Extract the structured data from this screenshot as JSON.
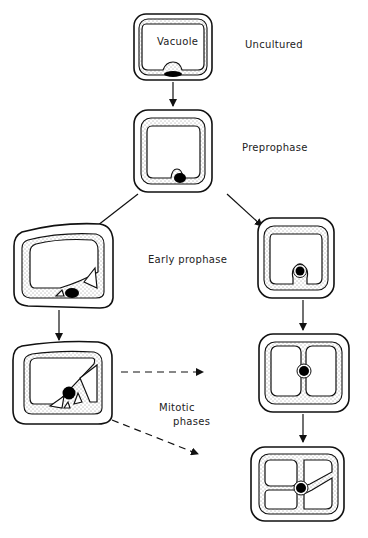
{
  "diagram": {
    "type": "flow",
    "labels": {
      "vacuole": "Vacuole",
      "uncultured": "Uncultured",
      "preprophase": "Preprophase",
      "early_prophase": "Early prophase",
      "mitotic_phases_line1": "Mitotic",
      "mitotic_phases_line2": "phases"
    },
    "nodes": [
      {
        "id": "cell-uncultured",
        "label": "Uncultured",
        "note": "Large central vacuole, nucleus at bottom wall"
      },
      {
        "id": "cell-preprophase",
        "label": "Preprophase",
        "note": "Nucleus bulges into vacuole at bottom"
      },
      {
        "id": "cell-early-prophase-left",
        "label": "Early prophase",
        "note": "Nucleus with small vacuole fragments"
      },
      {
        "id": "cell-early-prophase-right",
        "label": "",
        "note": "Nucleus surrounded by cytoplasm moving inward"
      },
      {
        "id": "cell-left-mitotic",
        "label": "",
        "note": "Cytoplasmic strands across vacuole, diagonal"
      },
      {
        "id": "cell-right-phragmosome",
        "label": "",
        "note": "Cross-shaped cytoplasmic strands, nucleus centered"
      },
      {
        "id": "cell-right-final",
        "label": "",
        "note": "Multiple strands, nucleus centered"
      }
    ],
    "edges": [
      {
        "from": "cell-uncultured",
        "to": "cell-preprophase",
        "style": "solid"
      },
      {
        "from": "cell-preprophase",
        "to": "cell-early-prophase-left",
        "style": "solid"
      },
      {
        "from": "cell-preprophase",
        "to": "cell-early-prophase-right",
        "style": "solid"
      },
      {
        "from": "cell-early-prophase-left",
        "to": "cell-left-mitotic",
        "style": "solid"
      },
      {
        "from": "cell-early-prophase-right",
        "to": "cell-right-phragmosome",
        "style": "solid"
      },
      {
        "from": "cell-right-phragmosome",
        "to": "cell-right-final",
        "style": "solid"
      },
      {
        "from": "cell-left-mitotic",
        "to": "cell-right-phragmosome",
        "style": "dashed",
        "label": "Mitotic phases"
      },
      {
        "from": "cell-left-mitotic",
        "to": "cell-right-final",
        "style": "dashed",
        "label": "Mitotic phases"
      }
    ],
    "colors": {
      "ink": "#111111",
      "background": "#ffffff"
    }
  }
}
